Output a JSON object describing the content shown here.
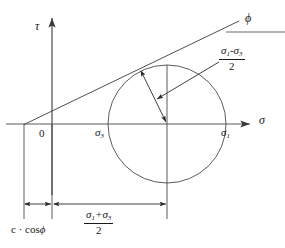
{
  "figure": {
    "background_color": "#ffffff",
    "line_color": "#3a3a3a",
    "text_color": "#1a1a1a",
    "width": 285,
    "height": 248
  },
  "axes": {
    "vertical_label": "τ",
    "horizontal_label": "σ",
    "origin_label": "0"
  },
  "labels": {
    "phi": "ϕ",
    "sigma3": "σ",
    "sigma3_sub": "3",
    "sigma1": "σ",
    "sigma1_sub": "1",
    "cohesion_term": "c · cos",
    "cohesion_phi": "ϕ"
  },
  "fractions": {
    "radius": {
      "numerator_left": "σ",
      "numerator_left_sub": "1",
      "numerator_operator": "-",
      "numerator_right": "σ",
      "numerator_right_sub": "3",
      "denominator": "2"
    },
    "center": {
      "numerator_left": "σ",
      "numerator_left_sub": "1",
      "numerator_operator": "+",
      "numerator_right": "σ",
      "numerator_right_sub": "3",
      "denominator": "2"
    }
  },
  "geometry": {
    "circle_center_x": 167,
    "circle_center_y": 124,
    "circle_radius": 59,
    "sigma_axis_y": 124,
    "tau_axis_x": 52,
    "envelope_start_x": 24,
    "envelope_start_y": 124,
    "envelope_end_x": 239,
    "envelope_end_y": 21,
    "tangent_point_x": 139,
    "tangent_point_y": 69,
    "dimension_line_y": 204
  }
}
